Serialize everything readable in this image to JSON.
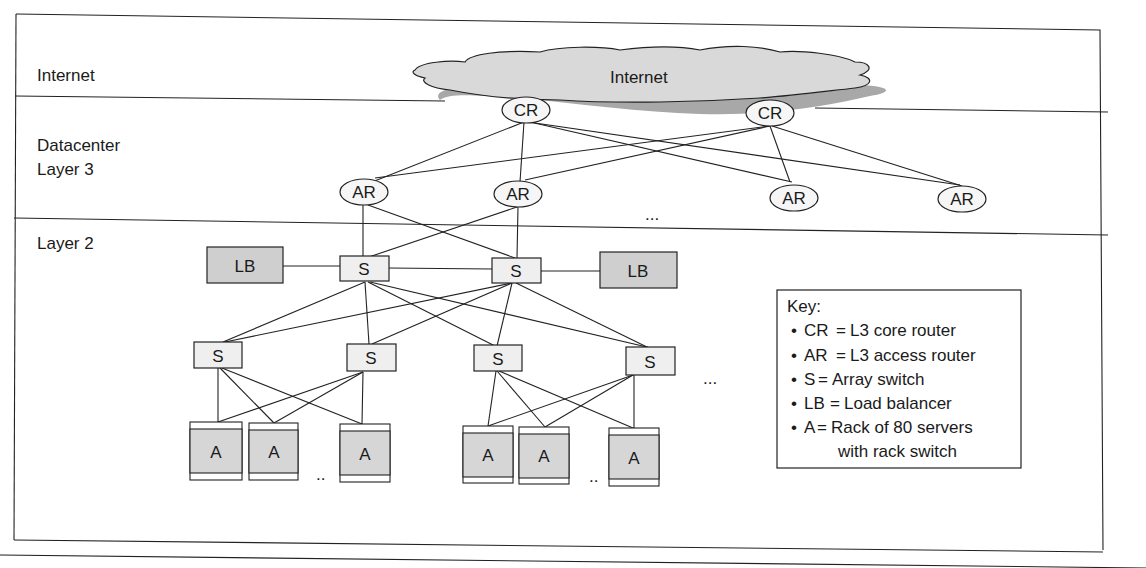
{
  "diagram": {
    "layers": [
      {
        "label": "Internet"
      },
      {
        "label_line1": "Datacenter",
        "label_line2": "Layer 3"
      },
      {
        "label": "Layer 2"
      }
    ],
    "cloud": {
      "label": "Internet",
      "fill": "#d9d9d9",
      "shadow": "#a8a8a8"
    },
    "core_routers": [
      {
        "label": "CR"
      },
      {
        "label": "CR"
      }
    ],
    "access_routers": [
      {
        "label": "AR"
      },
      {
        "label": "AR"
      },
      {
        "label": "AR"
      },
      {
        "label": "AR"
      }
    ],
    "access_routers_ellipsis": "...",
    "load_balancers": [
      {
        "label": "LB"
      },
      {
        "label": "LB"
      }
    ],
    "top_switches": [
      {
        "label": "S"
      },
      {
        "label": "S"
      }
    ],
    "array_switches": [
      {
        "label": "S"
      },
      {
        "label": "S"
      },
      {
        "label": "S"
      },
      {
        "label": "S"
      }
    ],
    "array_switches_ellipsis": "...",
    "racks_group1": [
      {
        "label": "A"
      },
      {
        "label": "A"
      },
      {
        "label": "A"
      }
    ],
    "racks_group2": [
      {
        "label": "A"
      },
      {
        "label": "A"
      },
      {
        "label": "A"
      }
    ],
    "racks_ellipsis": "..",
    "key": {
      "title": "Key:",
      "items": [
        {
          "bullet": "•",
          "abbr": "CR",
          "eq": "=",
          "text": "L3 core router"
        },
        {
          "bullet": "•",
          "abbr": "AR",
          "eq": "=",
          "text": "L3 access router"
        },
        {
          "bullet": "•",
          "abbr": "S",
          "eq": "=",
          "text": "Array switch"
        },
        {
          "bullet": "•",
          "abbr": "LB",
          "eq": "=",
          "text": "Load balancer"
        },
        {
          "bullet": "•",
          "abbr": "A",
          "eq": "=",
          "text": "Rack of 80 servers"
        }
      ],
      "continuation": "with rack switch"
    },
    "colors": {
      "node_light": "#efefef",
      "node_dark": "#cfcfcf",
      "rack_fill": "#d6d6d6",
      "line": "#222222"
    }
  }
}
